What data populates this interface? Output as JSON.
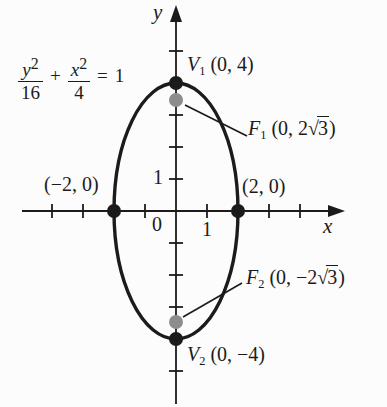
{
  "figure": {
    "ink_color": "#1b1b1b",
    "focus_dot_color": "#8d8d8d",
    "background_color": "#fcfcfc",
    "ellipse": {
      "equation_text": "y²/16 + x²/4 = 1",
      "semi_major_a": 4,
      "semi_minor_b": 2,
      "major_axis": "y",
      "center": [
        0,
        0
      ],
      "vertices": [
        [
          0,
          4
        ],
        [
          0,
          -4
        ]
      ],
      "foci": [
        [
          0,
          3.4641
        ],
        [
          0,
          -3.4641
        ]
      ],
      "x_intercepts": [
        [
          -2,
          0
        ],
        [
          2,
          0
        ]
      ]
    }
  },
  "equation": {
    "num1": "y",
    "sup1": "2",
    "den1": "16",
    "plus": "+",
    "num2": "x",
    "sup2": "2",
    "den2": "4",
    "equals": "=",
    "rhs": "1"
  },
  "axes": {
    "x_label": "x",
    "y_label": "y",
    "origin_label": "0",
    "x_unit_label": "1",
    "y_unit_label": "1"
  },
  "points": {
    "v1": {
      "name": "V",
      "sub": "1",
      "coords": " (0, 4)"
    },
    "v2": {
      "name": "V",
      "sub": "2",
      "coords": " (0, −4)"
    },
    "f1": {
      "name": "F",
      "sub": "1",
      "coords_pre": " (0, 2√",
      "radicand": "3",
      "coords_post": ")"
    },
    "f2": {
      "name": "F",
      "sub": "2",
      "coords_pre": " (0, −2√",
      "radicand": "3",
      "coords_post": ")"
    },
    "x_left": "(−2, 0)",
    "x_right": "(2, 0)"
  }
}
